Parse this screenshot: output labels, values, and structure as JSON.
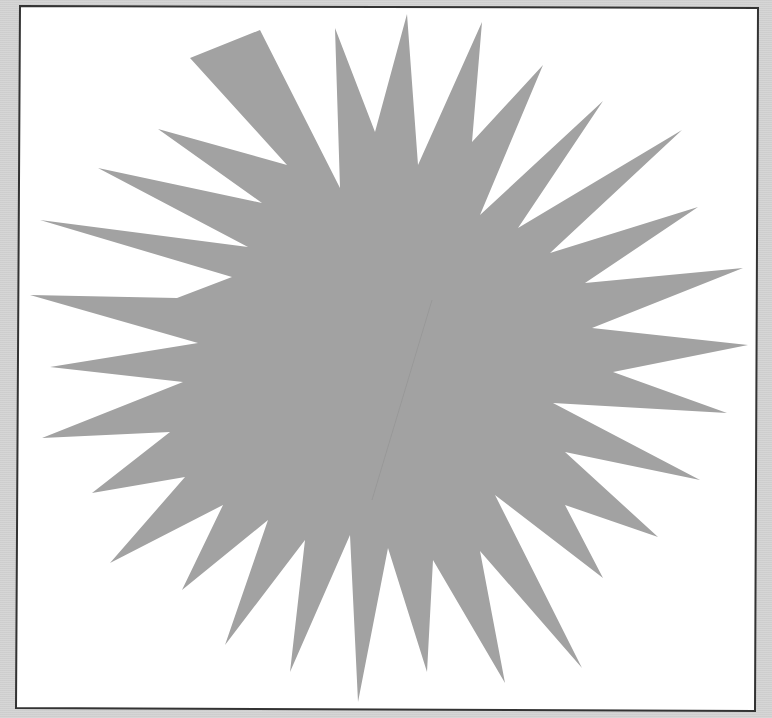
{
  "image": {
    "width": 772,
    "height": 718,
    "background_color": "#d4d4d4"
  },
  "frame": {
    "fill": "#ffffff",
    "stroke": "#333333",
    "stroke_width": 2,
    "corners": [
      [
        20,
        6
      ],
      [
        758,
        8
      ],
      [
        755,
        711
      ],
      [
        16,
        708
      ]
    ]
  },
  "starburst": {
    "fill": "#a2a2a2",
    "spike_count": 28,
    "points": [
      [
        407,
        14
      ],
      [
        418,
        165
      ],
      [
        482,
        22
      ],
      [
        472,
        142
      ],
      [
        543,
        65
      ],
      [
        480,
        215
      ],
      [
        603,
        101
      ],
      [
        518,
        228
      ],
      [
        682,
        130
      ],
      [
        550,
        253
      ],
      [
        698,
        207
      ],
      [
        585,
        283
      ],
      [
        743,
        268
      ],
      [
        592,
        328
      ],
      [
        748,
        345
      ],
      [
        613,
        372
      ],
      [
        727,
        413
      ],
      [
        553,
        403
      ],
      [
        700,
        480
      ],
      [
        565,
        452
      ],
      [
        658,
        537
      ],
      [
        565,
        505
      ],
      [
        603,
        578
      ],
      [
        495,
        495
      ],
      [
        582,
        668
      ],
      [
        480,
        551
      ],
      [
        505,
        683
      ],
      [
        433,
        560
      ],
      [
        427,
        672
      ],
      [
        388,
        548
      ],
      [
        358,
        702
      ],
      [
        350,
        535
      ],
      [
        290,
        672
      ],
      [
        305,
        540
      ],
      [
        225,
        645
      ],
      [
        268,
        520
      ],
      [
        182,
        590
      ],
      [
        223,
        505
      ],
      [
        110,
        563
      ],
      [
        185,
        477
      ],
      [
        92,
        493
      ],
      [
        170,
        432
      ],
      [
        42,
        438
      ],
      [
        183,
        382
      ],
      [
        50,
        367
      ],
      [
        198,
        343
      ],
      [
        30,
        295
      ],
      [
        177,
        298
      ],
      [
        232,
        277
      ],
      [
        40,
        220
      ],
      [
        248,
        247
      ],
      [
        98,
        168
      ],
      [
        262,
        203
      ],
      [
        158,
        129
      ],
      [
        287,
        165
      ],
      [
        190,
        58
      ],
      [
        260,
        30
      ],
      [
        340,
        188
      ],
      [
        335,
        28
      ],
      [
        375,
        132
      ]
    ],
    "fold_line": {
      "stroke": "#8f8f8f",
      "from": [
        432,
        300
      ],
      "to": [
        372,
        500
      ]
    }
  }
}
